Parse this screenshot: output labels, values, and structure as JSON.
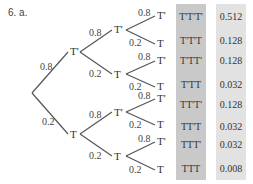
{
  "heading": "6. a.",
  "root_edges": [
    {
      "label": "0.8",
      "child": "T'"
    },
    {
      "label": "0.2",
      "child": "T"
    }
  ],
  "level2": [
    {
      "parent": "T'",
      "upper": {
        "label": "0.8",
        "child": "T'"
      },
      "lower": {
        "label": "0.2",
        "child": "T"
      }
    },
    {
      "parent": "T",
      "upper": {
        "label": "0.8",
        "child": "T'"
      },
      "lower": {
        "label": "0.2",
        "child": "T"
      }
    }
  ],
  "level3": [
    {
      "upper": {
        "label": "0.8",
        "child": "T'"
      },
      "lower": {
        "label": "0.2",
        "child": "T"
      }
    },
    {
      "upper": {
        "label": "0.8",
        "child": "T'"
      },
      "lower": {
        "label": "0.2",
        "child": "T"
      }
    },
    {
      "upper": {
        "label": "0.8",
        "child": "T'"
      },
      "lower": {
        "label": "0.2",
        "child": "T"
      }
    },
    {
      "upper": {
        "label": "0.8",
        "child": "T'"
      },
      "lower": {
        "label": "0.2",
        "child": "T"
      }
    }
  ],
  "outcomes": [
    "T'T'T'",
    "T'T'T",
    "T'TT'",
    "T'TT",
    "TT'T'",
    "TT'T",
    "TTT'",
    "TTT"
  ],
  "probabilities": [
    "0.512",
    "0.128",
    "0.128",
    "0.032",
    "0.128",
    "0.032",
    "0.032",
    "0.008"
  ],
  "colors": {
    "outcome_column": "#c9c9c9",
    "probability_column": "#e2e2e2",
    "lines": "#555555"
  }
}
